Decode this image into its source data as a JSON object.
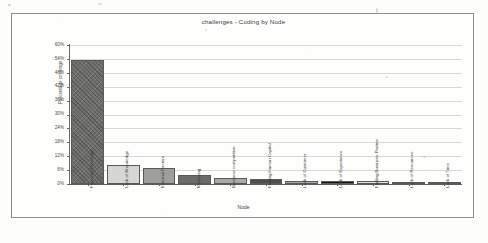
{
  "document": {
    "kind": "scanned-chart-figure"
  },
  "chart": {
    "title": "challenges - Coding by Node",
    "xlabel": "Node",
    "ylabel": "Percentage coverage"
  },
  "chart_data": {
    "type": "bar",
    "title": "challenges - Coding by Node",
    "xlabel": "Node",
    "ylabel": "Percentage coverage",
    "ylim": [
      0,
      60
    ],
    "ytick_labels": [
      "0%",
      "6%",
      "12%",
      "18%",
      "24%",
      "30%",
      "36%",
      "42%",
      "48%",
      "54%",
      "60%"
    ],
    "ytick_values": [
      0,
      6,
      12,
      18,
      24,
      30,
      36,
      42,
      48,
      54,
      60
    ],
    "grid": true,
    "legend": "none",
    "categories": [
      "Financial Challenge",
      "Lack of Knowledge",
      "External Factors",
      "Marketing",
      "Business competition",
      "Finding Human Capital",
      "Lack of Customer",
      "Lack of Experience",
      "Finding Business Partner",
      "Lack of Resources",
      "Lack of Time"
    ],
    "values": [
      53.5,
      8.0,
      7.0,
      4.0,
      2.5,
      2.2,
      1.4,
      1.3,
      1.1,
      0.4,
      0.3
    ],
    "bar_colors": [
      "#6e6e6c",
      "#d6d6d2",
      "#9e9e9b",
      "#6b6b69",
      "#a9a9a6",
      "#4e4e4c",
      "#a9a9a6",
      "#161615",
      "#e2e2de",
      "#6b6b69",
      "#9e9e9b"
    ]
  },
  "icons": {
    "none": ""
  }
}
